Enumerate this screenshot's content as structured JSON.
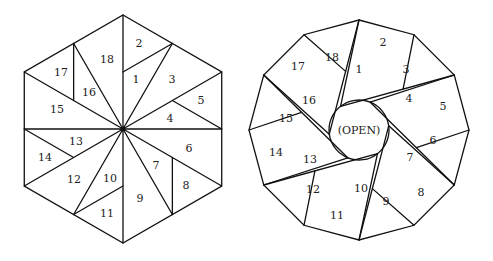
{
  "figure": {
    "left_diagram": {
      "shape": "hexagon",
      "center": [
        123,
        129
      ],
      "labels": [
        {
          "text": "1",
          "x": 136,
          "y": 79
        },
        {
          "text": "2",
          "x": 139,
          "y": 43
        },
        {
          "text": "3",
          "x": 172,
          "y": 79
        },
        {
          "text": "4",
          "x": 170,
          "y": 118
        },
        {
          "text": "5",
          "x": 201,
          "y": 100
        },
        {
          "text": "6",
          "x": 189,
          "y": 148
        },
        {
          "text": "7",
          "x": 156,
          "y": 165
        },
        {
          "text": "8",
          "x": 186,
          "y": 185
        },
        {
          "text": "9",
          "x": 140,
          "y": 198
        },
        {
          "text": "10",
          "x": 110,
          "y": 178
        },
        {
          "text": "11",
          "x": 107,
          "y": 213
        },
        {
          "text": "12",
          "x": 74,
          "y": 179
        },
        {
          "text": "13",
          "x": 76,
          "y": 141
        },
        {
          "text": "14",
          "x": 45,
          "y": 157
        },
        {
          "text": "15",
          "x": 57,
          "y": 109
        },
        {
          "text": "16",
          "x": 89,
          "y": 92
        },
        {
          "text": "17",
          "x": 61,
          "y": 72
        },
        {
          "text": "18",
          "x": 107,
          "y": 59
        }
      ]
    },
    "right_diagram": {
      "shape": "dodecagon",
      "center": [
        359,
        130
      ],
      "center_label": "(OPEN)",
      "labels": [
        {
          "text": "1",
          "x": 359,
          "y": 69
        },
        {
          "text": "2",
          "x": 383,
          "y": 42
        },
        {
          "text": "3",
          "x": 406,
          "y": 69
        },
        {
          "text": "4",
          "x": 409,
          "y": 98
        },
        {
          "text": "5",
          "x": 443,
          "y": 106
        },
        {
          "text": "6",
          "x": 433,
          "y": 140
        },
        {
          "text": "7",
          "x": 410,
          "y": 157
        },
        {
          "text": "8",
          "x": 421,
          "y": 192
        },
        {
          "text": "9",
          "x": 386,
          "y": 201
        },
        {
          "text": "10",
          "x": 361,
          "y": 188
        },
        {
          "text": "11",
          "x": 337,
          "y": 215
        },
        {
          "text": "12",
          "x": 313,
          "y": 189
        },
        {
          "text": "13",
          "x": 310,
          "y": 159
        },
        {
          "text": "14",
          "x": 276,
          "y": 152
        },
        {
          "text": "15",
          "x": 286,
          "y": 118
        },
        {
          "text": "16",
          "x": 309,
          "y": 100
        },
        {
          "text": "17",
          "x": 298,
          "y": 66
        },
        {
          "text": "18",
          "x": 332,
          "y": 57
        }
      ]
    }
  }
}
